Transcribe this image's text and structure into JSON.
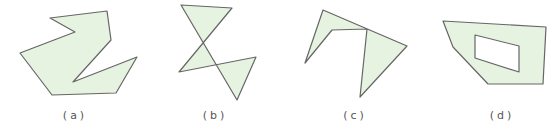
{
  "colors": {
    "fill": "#e6f3e0",
    "stroke": "#666666",
    "hole": "#ffffff"
  },
  "figures": [
    {
      "label": "(a)",
      "label_x": 75,
      "points": "50,18 107,11 111,40 73,82 137,57 116,93 52,95 20,53 75,32"
    },
    {
      "label": "(b)",
      "label_x": 215,
      "points": "181,5 232,8 179,72 256,57 237,100"
    },
    {
      "label": "(c)",
      "label_x": 355,
      "points": "323,10 407,46 360,97 367,29 332,30 305,63"
    },
    {
      "label": "(d)",
      "label_x": 502,
      "points": "443,21 546,27 543,84 488,84 453,47",
      "hole": "475,35 519,46 519,72 475,58"
    }
  ]
}
